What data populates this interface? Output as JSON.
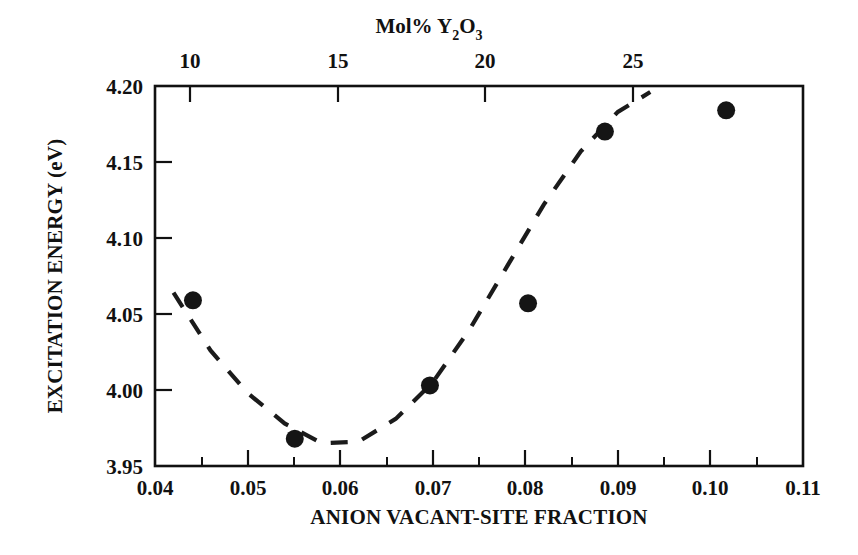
{
  "chart_data": {
    "type": "scatter",
    "title": "",
    "xlabel": "ANION VACANT-SITE FRACTION",
    "ylabel": "EXCITATION ENERGY (eV)",
    "top_axis_label": "Mol% Y2O3",
    "top_axis_label_parts": {
      "prefix": "Mol% Y",
      "sub1": "2",
      "mid": "O",
      "sub2": "3"
    },
    "xlim": [
      0.04,
      0.11
    ],
    "ylim": [
      3.95,
      4.2
    ],
    "top_xlim": [
      5.9,
      27.5
    ],
    "grid": false,
    "legend": null,
    "xticks": [
      "0.04",
      "0.05",
      "0.06",
      "0.07",
      "0.08",
      "0.09",
      "0.10",
      "0.11"
    ],
    "xtick_values": [
      0.04,
      0.05,
      0.06,
      0.07,
      0.08,
      0.09,
      0.1,
      0.11
    ],
    "x_minor_values": [
      0.045,
      0.055,
      0.065,
      0.075,
      0.085,
      0.095,
      0.105
    ],
    "yticks": [
      "3.95",
      "4.00",
      "4.05",
      "4.10",
      "4.15",
      "4.20"
    ],
    "ytick_values": [
      3.95,
      4.0,
      4.05,
      4.1,
      4.15,
      4.2
    ],
    "top_xticks": [
      "10",
      "15",
      "20",
      "25"
    ],
    "top_xtick_values": [
      10,
      15,
      20,
      25
    ],
    "series": [
      {
        "name": "excitation energy",
        "marker": "filled-circle",
        "color": "#151515",
        "x": [
          0.0441,
          0.0551,
          0.0697,
          0.0803,
          0.0886,
          0.1017
        ],
        "y": [
          4.059,
          3.968,
          4.003,
          4.057,
          4.17,
          4.184
        ]
      },
      {
        "name": "dashed fit curve",
        "style": "dashed",
        "color": "#1b1b1b",
        "x": [
          0.042,
          0.046,
          0.05,
          0.054,
          0.058,
          0.062,
          0.066,
          0.07,
          0.074,
          0.078,
          0.082,
          0.086,
          0.09,
          0.0935
        ],
        "y": [
          4.064,
          4.026,
          3.998,
          3.978,
          3.965,
          3.966,
          3.981,
          4.005,
          4.04,
          4.081,
          4.122,
          4.157,
          4.183,
          4.196
        ]
      }
    ]
  }
}
